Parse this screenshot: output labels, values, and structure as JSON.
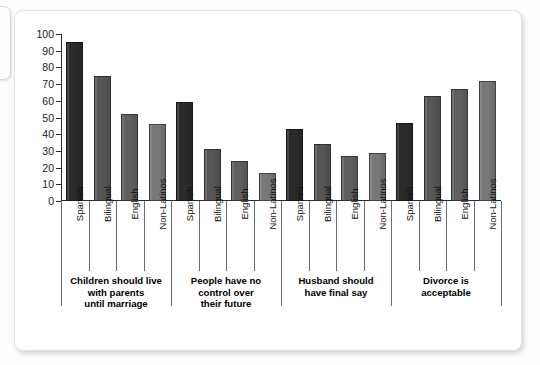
{
  "chart_data": {
    "type": "bar",
    "title": "",
    "subtitle": "",
    "xlabel": "",
    "ylabel": "",
    "ylim": [
      0,
      100
    ],
    "ytick_labels": [
      "100",
      "90",
      "80",
      "70",
      "60",
      "50",
      "40",
      "30",
      "20",
      "10",
      "0"
    ],
    "ytick_values": [
      100,
      90,
      80,
      70,
      60,
      50,
      40,
      30,
      20,
      10,
      0
    ],
    "grid": false,
    "legend_position": "none",
    "categories": [
      "Children should live with parents until marriage",
      "People have no control over their future",
      "Husband should have final say",
      "Divorce is acceptable"
    ],
    "group_caption_lines": [
      [
        "Children should live",
        "with parents",
        "until marriage"
      ],
      [
        "People have no",
        "control over",
        "their future"
      ],
      [
        "Husband should",
        "have final say"
      ],
      [
        "Divorce is",
        "acceptable"
      ]
    ],
    "subcategories": [
      "Spanish",
      "Bilingual",
      "English",
      "Non-Latinos"
    ],
    "series": [
      {
        "name": "Spanish",
        "color": "#2b2b2b",
        "values": [
          95,
          59,
          43,
          47
        ]
      },
      {
        "name": "Bilingual",
        "color": "#565656",
        "values": [
          75,
          31,
          34,
          63
        ]
      },
      {
        "name": "English",
        "color": "#5f5f5f",
        "values": [
          52,
          24,
          27,
          67
        ]
      },
      {
        "name": "Non-Latinos",
        "color": "#787878",
        "values": [
          46,
          17,
          29,
          72
        ]
      }
    ],
    "bars": [
      {
        "group": 0,
        "label": "Spanish",
        "value": 95,
        "color": "#2b2b2b"
      },
      {
        "group": 0,
        "label": "Bilingual",
        "value": 75,
        "color": "#565656"
      },
      {
        "group": 0,
        "label": "English",
        "value": 52,
        "color": "#5f5f5f"
      },
      {
        "group": 0,
        "label": "Non-Latinos",
        "value": 46,
        "color": "#787878"
      },
      {
        "group": 1,
        "label": "Spanish",
        "value": 59,
        "color": "#2b2b2b"
      },
      {
        "group": 1,
        "label": "Bilingual",
        "value": 31,
        "color": "#565656"
      },
      {
        "group": 1,
        "label": "English",
        "value": 24,
        "color": "#5f5f5f"
      },
      {
        "group": 1,
        "label": "Non-Latinos",
        "value": 17,
        "color": "#787878"
      },
      {
        "group": 2,
        "label": "Spanish",
        "value": 43,
        "color": "#2b2b2b"
      },
      {
        "group": 2,
        "label": "Bilingual",
        "value": 34,
        "color": "#565656"
      },
      {
        "group": 2,
        "label": "English",
        "value": 27,
        "color": "#5f5f5f"
      },
      {
        "group": 2,
        "label": "Non-Latinos",
        "value": 29,
        "color": "#787878"
      },
      {
        "group": 3,
        "label": "Spanish",
        "value": 47,
        "color": "#2b2b2b"
      },
      {
        "group": 3,
        "label": "Bilingual",
        "value": 63,
        "color": "#565656"
      },
      {
        "group": 3,
        "label": "English",
        "value": 67,
        "color": "#5f5f5f"
      },
      {
        "group": 3,
        "label": "Non-Latinos",
        "value": 72,
        "color": "#787878"
      }
    ]
  },
  "figure": {
    "axis_color": "#2b2b2b",
    "grid_color": "#6d6d6d",
    "panel_background": "#ffffff"
  }
}
